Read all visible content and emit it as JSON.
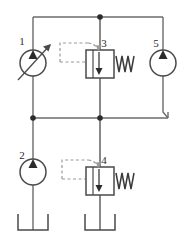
{
  "diagram": {
    "type": "hydraulic-schematic",
    "background_color": "#ffffff",
    "line_color": "#6b6b6b",
    "dark_line_color": "#3a3a3a",
    "label_color": "#2b2b2b",
    "dash_color": "#8c8c8c",
    "width": 187,
    "height": 238,
    "components": [
      {
        "id": "1",
        "label": "1",
        "name": "variable-displacement-pump",
        "symbol": "circle-with-triangle-and-variability-arrow",
        "cx": 33,
        "cy": 63,
        "r": 13,
        "label_x": 22,
        "label_y": 45
      },
      {
        "id": "2",
        "label": "2",
        "name": "fixed-displacement-pump",
        "symbol": "circle-with-triangle",
        "cx": 33,
        "cy": 172,
        "r": 13,
        "label_x": 22,
        "label_y": 159
      },
      {
        "id": "3",
        "label": "3",
        "name": "pilot-operated-relief-valve-upper",
        "symbol": "square-valve-with-spring-and-pilot-line",
        "x": 86,
        "y": 50,
        "w": 28,
        "h": 28,
        "label_x": 104,
        "label_y": 47
      },
      {
        "id": "4",
        "label": "4",
        "name": "pilot-operated-relief-valve-lower",
        "symbol": "square-valve-with-spring-and-pilot-line",
        "x": 86,
        "y": 167,
        "w": 28,
        "h": 28,
        "label_x": 104,
        "label_y": 164
      },
      {
        "id": "5",
        "label": "5",
        "name": "hydraulic-motor",
        "symbol": "circle-with-triangle",
        "cx": 163,
        "cy": 63,
        "r": 13,
        "label_x": 155,
        "label_y": 47
      }
    ],
    "junctions": [
      {
        "name": "junction-top-center",
        "x": 100,
        "y": 17
      },
      {
        "name": "junction-mid-left",
        "x": 33,
        "y": 118
      },
      {
        "name": "junction-mid-center",
        "x": 100,
        "y": 118
      }
    ],
    "tanks": [
      {
        "name": "tank-reservoir-left",
        "x": 18,
        "y": 214,
        "w": 30,
        "h": 16
      },
      {
        "name": "tank-reservoir-center",
        "x": 85,
        "y": 214,
        "w": 30,
        "h": 16
      }
    ],
    "springs": [
      {
        "name": "spring-valve-3",
        "x": 115,
        "y": 55,
        "w": 20,
        "h": 18
      },
      {
        "name": "spring-valve-4",
        "x": 115,
        "y": 172,
        "w": 20,
        "h": 18
      }
    ],
    "pilot_lines": [
      {
        "name": "pilot-line-valve-3",
        "from_x": 60,
        "from_y": 45,
        "to_x": 98,
        "to_y": 52
      },
      {
        "name": "pilot-line-valve-4",
        "from_x": 62,
        "from_y": 160,
        "to_x": 98,
        "to_y": 169
      }
    ],
    "lines": [
      {
        "name": "line-top-rail",
        "x1": 33,
        "y1": 17,
        "x2": 163,
        "y2": 17
      },
      {
        "name": "line-mid-rail",
        "x1": 33,
        "y1": 118,
        "x2": 168,
        "y2": 118
      },
      {
        "name": "line-pump1-to-top",
        "x1": 33,
        "y1": 17,
        "x2": 33,
        "y2": 50
      },
      {
        "name": "line-pump1-to-mid",
        "x1": 33,
        "y1": 76,
        "x2": 33,
        "y2": 118
      },
      {
        "name": "line-valve3-to-top",
        "x1": 100,
        "y1": 17,
        "x2": 100,
        "y2": 50
      },
      {
        "name": "line-valve3-to-mid",
        "x1": 100,
        "y1": 78,
        "x2": 100,
        "y2": 118
      },
      {
        "name": "line-motor5-to-top",
        "x1": 163,
        "y1": 17,
        "x2": 163,
        "y2": 50
      },
      {
        "name": "line-motor5-to-mid",
        "x1": 163,
        "y1": 76,
        "x2": 168,
        "y2": 118
      },
      {
        "name": "line-mid-to-pump2",
        "x1": 33,
        "y1": 118,
        "x2": 33,
        "y2": 159
      },
      {
        "name": "line-pump2-to-tank",
        "x1": 33,
        "y1": 185,
        "x2": 33,
        "y2": 230
      },
      {
        "name": "line-mid-to-valve4",
        "x1": 100,
        "y1": 118,
        "x2": 100,
        "y2": 167
      },
      {
        "name": "line-valve4-to-tank",
        "x1": 100,
        "y1": 195,
        "x2": 100,
        "y2": 230
      }
    ]
  }
}
